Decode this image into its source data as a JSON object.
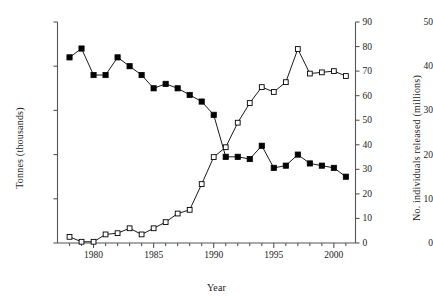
{
  "chart_data": {
    "type": "line",
    "title": "",
    "xlabel": "Year",
    "x": [
      1978,
      1979,
      1980,
      1981,
      1982,
      1983,
      1984,
      1985,
      1986,
      1987,
      1988,
      1989,
      1990,
      1991,
      1992,
      1993,
      1994,
      1995,
      1996,
      1997,
      1998,
      1999,
      2000,
      2001
    ],
    "xlim": [
      1977,
      2001.8
    ],
    "xticks": [
      1980,
      1985,
      1990,
      1995,
      2000
    ],
    "xticklabels": [
      "1980",
      "1985",
      "1990",
      "1995",
      "2000"
    ],
    "minor_xticks_every": 1,
    "grid": false,
    "legend": "none",
    "series": [
      {
        "name": "Tonnes (thousands)",
        "axis": "left",
        "marker": "filled-square",
        "color": "#000000",
        "ylabel": "Tonnes (thousands)",
        "ylim": [
          0,
          50
        ],
        "yticks": [
          0,
          10,
          20,
          30,
          40,
          50
        ],
        "yticklabels": [
          "0",
          "10",
          "20",
          "30",
          "40",
          "50"
        ],
        "values": [
          42.0,
          44.0,
          38.0,
          38.0,
          42.0,
          40.0,
          38.0,
          35.0,
          36.0,
          35.0,
          33.5,
          32.0,
          29.0,
          19.5,
          19.5,
          19.0,
          22.0,
          17.0,
          17.5,
          20.0,
          18.0,
          17.5,
          17.0,
          15.0
        ]
      },
      {
        "name": "No. individuals released (millions)",
        "axis": "right",
        "marker": "open-square",
        "color": "#000000",
        "ylabel": "No. individuals released (millions)",
        "ylim": [
          0,
          90
        ],
        "yticks": [
          0,
          10,
          20,
          30,
          40,
          50,
          60,
          70,
          80,
          90
        ],
        "yticklabels": [
          "0",
          "10",
          "20",
          "30",
          "40",
          "50",
          "60",
          "70",
          "80",
          "90"
        ],
        "values": [
          2.5,
          0.5,
          0.5,
          3.5,
          4.0,
          6.0,
          3.5,
          6.0,
          8.5,
          12.0,
          13.5,
          24.0,
          35.0,
          39.0,
          49.0,
          57.0,
          63.5,
          61.5,
          65.5,
          79.0,
          69.0,
          69.5,
          70.0,
          68.0
        ]
      }
    ]
  },
  "axes": {
    "x_title": "Year",
    "y_left_title": "Tonnes (thousands)",
    "y_right_title": "No. individuals released (millions)"
  }
}
